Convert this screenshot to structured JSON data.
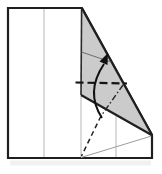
{
  "diagram": {
    "kind": "origami-step-diagram",
    "canvas": {
      "width": 162,
      "height": 174,
      "background": "#ffffff"
    },
    "palette": {
      "paper": "#ffffff",
      "outline": "#1f1f1f",
      "crease": "#b6b6b6",
      "flap_fill": "#cbcbcb",
      "fold_line": "#141414",
      "arrow": "#111111",
      "shadow": "#e3e3e3"
    },
    "fold_symbols": {
      "valley_fold": "dashed-line",
      "mountain_fold": "dash-dot-line",
      "direction": "curved-arrow-up"
    },
    "elements": [
      {
        "kind": "rect",
        "name": "paper-drop-shadow",
        "x": 10,
        "y": 160.5,
        "width": 141,
        "height": 5,
        "fill": "#e3e3e3",
        "opacity": 0.5
      },
      {
        "kind": "polygon",
        "name": "paper-outline",
        "points": "8,8 82,8 152,135 152,158 8,158",
        "fill": "#ffffff",
        "stroke": "#1f1f1f",
        "stroke_width": 2.2,
        "stroke_linejoin": "miter"
      },
      {
        "kind": "line",
        "name": "crease-quarter-left",
        "x1": 44,
        "y1": 9,
        "x2": 44,
        "y2": 157,
        "stroke": "#b6b6b6",
        "stroke_width": 1
      },
      {
        "kind": "line",
        "name": "crease-quarter-mid-lower",
        "x1": 81,
        "y1": 96,
        "x2": 81,
        "y2": 157,
        "stroke": "#b6b6b6",
        "stroke_width": 1
      },
      {
        "kind": "line",
        "name": "crease-quarter-right-lower",
        "x1": 116,
        "y1": 115,
        "x2": 116,
        "y2": 157,
        "stroke": "#b6b6b6",
        "stroke_width": 1
      },
      {
        "kind": "line",
        "name": "crease-diagonal-to-corner",
        "x1": 81,
        "y1": 157.5,
        "x2": 151.5,
        "y2": 136,
        "stroke": "#9c9c9c",
        "stroke_width": 1
      },
      {
        "kind": "polygon",
        "name": "folded-flap",
        "points": "82,8.5 151.8,135.2 81,95",
        "fill": "#cbcbcb"
      },
      {
        "kind": "line",
        "name": "flap-left-edge",
        "x1": 81.6,
        "y1": 8.5,
        "x2": 81,
        "y2": 95,
        "stroke": "#2a2a2a",
        "stroke_width": 1.6
      },
      {
        "kind": "line",
        "name": "flap-bottom-edge",
        "x1": 81,
        "y1": 95,
        "x2": 152,
        "y2": 135.3,
        "stroke": "#1f1f1f",
        "stroke_width": 2.2
      },
      {
        "kind": "line",
        "name": "flap-folded-edge-hypotenuse",
        "x1": 82,
        "y1": 8.5,
        "x2": 152,
        "y2": 135,
        "stroke": "#1f1f1f",
        "stroke_width": 2.2
      },
      {
        "kind": "line",
        "name": "flap-inner-crease",
        "x1": 81.5,
        "y1": 52,
        "x2": 111,
        "y2": 62,
        "stroke": "#6e6e6e",
        "stroke_width": 1
      },
      {
        "kind": "line",
        "name": "valley-fold-horizontal",
        "x1": 75.5,
        "y1": 82.5,
        "x2": 127,
        "y2": 83.5,
        "stroke": "#141414",
        "stroke_width": 2.2,
        "stroke_dasharray": "8,4"
      },
      {
        "kind": "line",
        "name": "mountain-fold-dash-dot",
        "x1": 123,
        "y1": 85,
        "x2": 101,
        "y2": 116,
        "stroke": "#242424",
        "stroke_width": 1.4,
        "stroke_dasharray": "6,2.5,1.5,2.5"
      },
      {
        "kind": "line",
        "name": "valley-fold-steep",
        "x1": 101,
        "y1": 116,
        "x2": 81.5,
        "y2": 156,
        "stroke": "#242424",
        "stroke_width": 1.5,
        "stroke_dasharray": "5,3.5"
      },
      {
        "kind": "path",
        "name": "fold-arrow-arc",
        "d": "M 102,118 Q 85,92 104,64",
        "fill": "none",
        "stroke": "#111111",
        "stroke_width": 2
      },
      {
        "kind": "polygon",
        "name": "fold-arrow-head",
        "points": "108,53 107.5,65 99.5,61.5",
        "fill": "#111111"
      }
    ]
  }
}
